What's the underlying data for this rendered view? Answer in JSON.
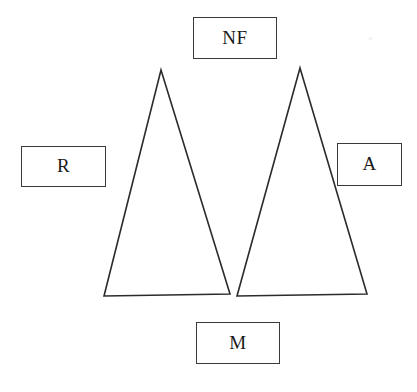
{
  "diagram": {
    "background_color": "#ffffff",
    "stroke_color": "#2b2b2b",
    "label_border_color": "#3a3a3a",
    "label_text_color": "#1a1a1a",
    "width": 417,
    "height": 392,
    "shapes": [
      {
        "name": "left-triangle",
        "type": "triangle",
        "points": "161,70 230,294 104,296"
      },
      {
        "name": "right-triangle",
        "type": "triangle",
        "points": "300,68 367,294 237,296"
      }
    ],
    "labels": {
      "top": {
        "text": "NF",
        "name": "label-nf"
      },
      "left": {
        "text": "R",
        "name": "label-r"
      },
      "right": {
        "text": "A",
        "name": "label-a"
      },
      "bottom": {
        "text": "M",
        "name": "label-m"
      }
    }
  }
}
